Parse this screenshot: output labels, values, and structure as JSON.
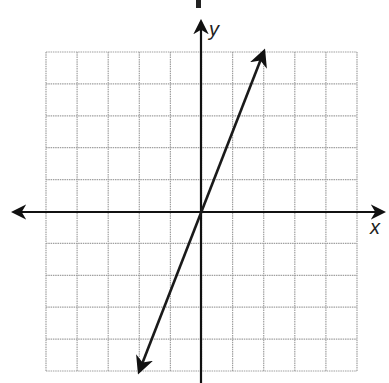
{
  "chart_data": {
    "type": "line",
    "title": "",
    "xlabel": "x",
    "ylabel": "y",
    "xlim": [
      -5,
      5
    ],
    "ylim": [
      -5,
      5
    ],
    "grid": true,
    "grid_step": 1,
    "series": [
      {
        "name": "line",
        "equation": "y = 2.5x",
        "x": [
          -2,
          2
        ],
        "y": [
          -5,
          5
        ],
        "arrows_both_ends": true
      }
    ]
  },
  "labels": {
    "x_axis": "x",
    "y_axis": "y"
  },
  "colors": {
    "grid": "#a0a0a0",
    "axes": "#111111",
    "line": "#1a1a1a"
  }
}
